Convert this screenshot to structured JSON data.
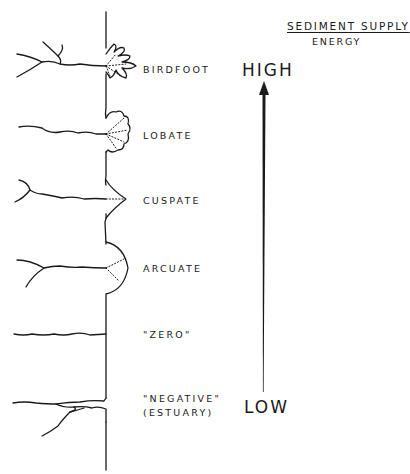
{
  "header": {
    "title": "SEDIMENT SUPPLY",
    "subtitle": "ENERGY"
  },
  "scale": {
    "high_label": "HIGH",
    "low_label": "LOW",
    "direction": "increasing-upward"
  },
  "delta_types": [
    {
      "label": "BIRDFOOT"
    },
    {
      "label": "LOBATE"
    },
    {
      "label": "CUSPATE"
    },
    {
      "label": "ARCUATE"
    },
    {
      "label": "\"ZERO\""
    },
    {
      "label_line1": "\"NEGATIVE\"",
      "label_line2": "(ESTUARY)"
    }
  ],
  "colors": {
    "ink": "#1a1a1a",
    "background": "#ffffff"
  }
}
